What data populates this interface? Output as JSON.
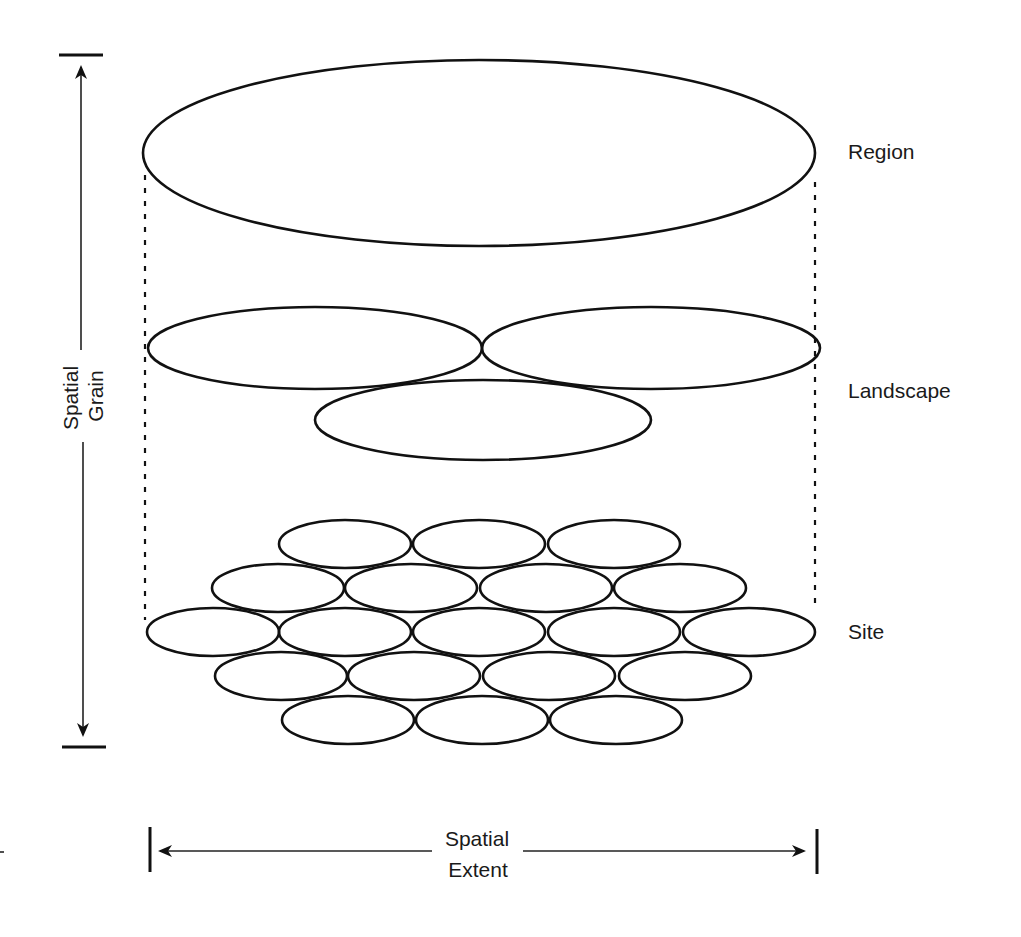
{
  "diagram": {
    "levels": [
      {
        "label": "Region"
      },
      {
        "label": "Landscape"
      },
      {
        "label": "Site"
      }
    ],
    "axes": {
      "vertical": {
        "line1": "Spatial",
        "line2": "Grain"
      },
      "horizontal": {
        "line1": "Spatial",
        "line2": "Extent"
      }
    },
    "colors": {
      "stroke": "#111111",
      "background": "#ffffff"
    },
    "region_ellipse": {
      "cx": 479,
      "cy": 153,
      "rx": 336,
      "ry": 93
    },
    "landscape_ellipses": [
      {
        "cx": 315,
        "cy": 348,
        "rx": 167,
        "ry": 41
      },
      {
        "cx": 651,
        "cy": 348,
        "rx": 169,
        "ry": 41
      },
      {
        "cx": 483,
        "cy": 420,
        "rx": 168,
        "ry": 40
      }
    ],
    "site_ellipses": {
      "rx": 66,
      "ry": 24,
      "rows": [
        {
          "cy": 544,
          "cx": [
            345,
            479,
            614
          ]
        },
        {
          "cy": 588,
          "cx": [
            278,
            411,
            546,
            680
          ]
        },
        {
          "cy": 632,
          "cx": [
            213,
            345,
            479,
            614,
            749
          ]
        },
        {
          "cy": 676,
          "cx": [
            281,
            414,
            549,
            685
          ]
        },
        {
          "cy": 720,
          "cx": [
            348,
            482,
            616
          ]
        }
      ]
    }
  }
}
